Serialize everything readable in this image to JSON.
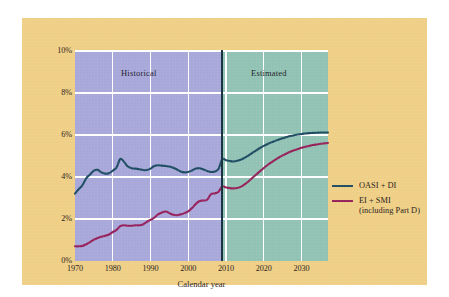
{
  "chart_data": {
    "type": "line",
    "title": "",
    "xlabel": "Calendar year",
    "ylabel": "",
    "xlim": [
      1970,
      2037
    ],
    "ylim": [
      0,
      10
    ],
    "grid": true,
    "y_tick_labels": [
      "0%",
      "2%",
      "4%",
      "6%",
      "8%",
      "10%"
    ],
    "y_ticks": [
      0,
      2,
      4,
      6,
      8,
      10
    ],
    "x_tick_labels": [
      "1970",
      "1980",
      "1990",
      "2000",
      "2010",
      "2020",
      "2030"
    ],
    "x_ticks": [
      1970,
      1980,
      1990,
      2000,
      2010,
      2020,
      2030
    ],
    "annotations": [
      {
        "text": "Historical",
        "region": "historical",
        "x_range": [
          1970,
          2009
        ]
      },
      {
        "text": "Estimated",
        "region": "estimated",
        "x_range": [
          2009,
          2037
        ]
      }
    ],
    "divider_x": 2009,
    "region_colors": {
      "historical": "#a7a7da",
      "estimated": "#91c2b3"
    },
    "plot_background": "#efcf86",
    "gridline_color": "#ffffff",
    "legend_position": "right",
    "series": [
      {
        "name": "OASI + DI",
        "color": "#1d4c62",
        "x": [
          1970,
          1971,
          1972,
          1973,
          1974,
          1975,
          1976,
          1977,
          1978,
          1979,
          1980,
          1981,
          1982,
          1983,
          1984,
          1985,
          1986,
          1987,
          1988,
          1989,
          1990,
          1991,
          1992,
          1993,
          1994,
          1995,
          1996,
          1997,
          1998,
          1999,
          2000,
          2001,
          2002,
          2003,
          2004,
          2005,
          2006,
          2007,
          2008,
          2009,
          2010,
          2011,
          2012,
          2013,
          2014,
          2015,
          2016,
          2017,
          2018,
          2019,
          2020,
          2021,
          2022,
          2023,
          2024,
          2025,
          2026,
          2027,
          2028,
          2029,
          2030,
          2031,
          2032,
          2033,
          2034,
          2035,
          2036,
          2037
        ],
        "values": [
          3.21,
          3.42,
          3.62,
          3.95,
          4.12,
          4.3,
          4.34,
          4.22,
          4.16,
          4.18,
          4.3,
          4.45,
          4.86,
          4.72,
          4.5,
          4.42,
          4.4,
          4.37,
          4.33,
          4.33,
          4.4,
          4.52,
          4.56,
          4.54,
          4.52,
          4.5,
          4.44,
          4.36,
          4.26,
          4.22,
          4.24,
          4.31,
          4.4,
          4.42,
          4.36,
          4.29,
          4.24,
          4.26,
          4.38,
          4.85,
          4.8,
          4.76,
          4.74,
          4.77,
          4.83,
          4.92,
          5.03,
          5.15,
          5.27,
          5.38,
          5.48,
          5.57,
          5.65,
          5.72,
          5.79,
          5.85,
          5.9,
          5.95,
          5.99,
          6.02,
          6.05,
          6.07,
          6.09,
          6.1,
          6.11,
          6.12,
          6.12,
          6.12
        ]
      },
      {
        "name": "EI + SMI",
        "sublabel": "(including Part D)",
        "color": "#96205a",
        "x": [
          1970,
          1971,
          1972,
          1973,
          1974,
          1975,
          1976,
          1977,
          1978,
          1979,
          1980,
          1981,
          1982,
          1983,
          1984,
          1985,
          1986,
          1987,
          1988,
          1989,
          1990,
          1991,
          1992,
          1993,
          1994,
          1995,
          1996,
          1997,
          1998,
          1999,
          2000,
          2001,
          2002,
          2003,
          2004,
          2005,
          2006,
          2007,
          2008,
          2009,
          2010,
          2011,
          2012,
          2013,
          2014,
          2015,
          2016,
          2017,
          2018,
          2019,
          2020,
          2021,
          2022,
          2023,
          2024,
          2025,
          2026,
          2027,
          2028,
          2029,
          2030,
          2031,
          2032,
          2033,
          2034,
          2035,
          2036,
          2037
        ],
        "values": [
          0.7,
          0.7,
          0.72,
          0.8,
          0.9,
          1.02,
          1.1,
          1.16,
          1.2,
          1.26,
          1.38,
          1.48,
          1.66,
          1.7,
          1.68,
          1.68,
          1.7,
          1.7,
          1.74,
          1.86,
          1.96,
          2.06,
          2.22,
          2.31,
          2.36,
          2.28,
          2.2,
          2.18,
          2.22,
          2.28,
          2.36,
          2.52,
          2.72,
          2.86,
          2.88,
          2.92,
          3.18,
          3.22,
          3.3,
          3.55,
          3.5,
          3.47,
          3.46,
          3.48,
          3.54,
          3.66,
          3.8,
          3.96,
          4.12,
          4.28,
          4.43,
          4.57,
          4.7,
          4.82,
          4.93,
          5.03,
          5.12,
          5.2,
          5.27,
          5.33,
          5.39,
          5.44,
          5.48,
          5.52,
          5.55,
          5.58,
          5.6,
          5.62
        ]
      }
    ]
  },
  "legend": {
    "items": [
      {
        "label": "OASI + DI",
        "sublabel": "",
        "color": "#1d4c62"
      },
      {
        "label": "EI + SMI",
        "sublabel": "(including Part D)",
        "color": "#96205a"
      }
    ]
  }
}
